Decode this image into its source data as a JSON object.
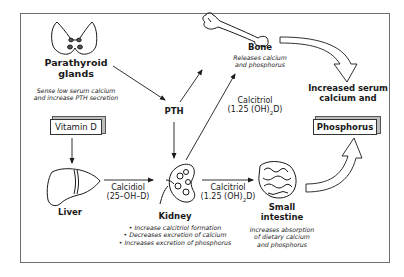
{
  "organs": {
    "parathyroid": {
      "label_line1": "Parathyroid",
      "label_line2": "glands",
      "note_line1": "Sense low serum calcium",
      "note_line2": "and increase PTH secretion",
      "icon": "parathyroid-icon"
    },
    "bone": {
      "label": "Bone",
      "note_line1": "Releases calcium",
      "note_line2": "and phosphorus",
      "icon": "bone-icon"
    },
    "liver": {
      "label": "Liver",
      "icon": "liver-icon"
    },
    "kidney": {
      "label": "Kidney",
      "bullets": [
        "• Increase calcitriol formation",
        "• Decreases excretion of calcium",
        "• Increases excretion of phosphorus"
      ],
      "icon": "kidney-icon"
    },
    "small_intestine": {
      "label_line1": "Small",
      "label_line2": "intestine",
      "note_line1": "Increases absorption",
      "note_line2": "of dietary calcium",
      "note_line3": "and phosphorus",
      "icon": "intestine-icon"
    }
  },
  "boxes": {
    "vitamin_d": "Vitamin D",
    "phosphorus": "Phosphorus"
  },
  "hormones": {
    "pth": "PTH",
    "calcidiol_line1": "Calcidiol",
    "calcidiol_line2": "(25–OH–D)",
    "calcitriol_bone_line1": "Calcitriol",
    "calcitriol_bone_line2_pre": "(1.25 (OH)",
    "calcitriol_bone_line2_sub": "2",
    "calcitriol_bone_line2_post": "D)",
    "calcitriol_int_line1": "Calcitriol",
    "calcitriol_int_line2_pre": "(1.25 (OH)",
    "calcitriol_int_line2_sub": "2",
    "calcitriol_int_line2_post": "D)"
  },
  "outcome": {
    "line1": "Increased serum",
    "line2": "calcium and"
  },
  "colors": {
    "stroke": "#1a1a1a",
    "frame": "#6e6e6e",
    "gland_fill": "#555555"
  }
}
